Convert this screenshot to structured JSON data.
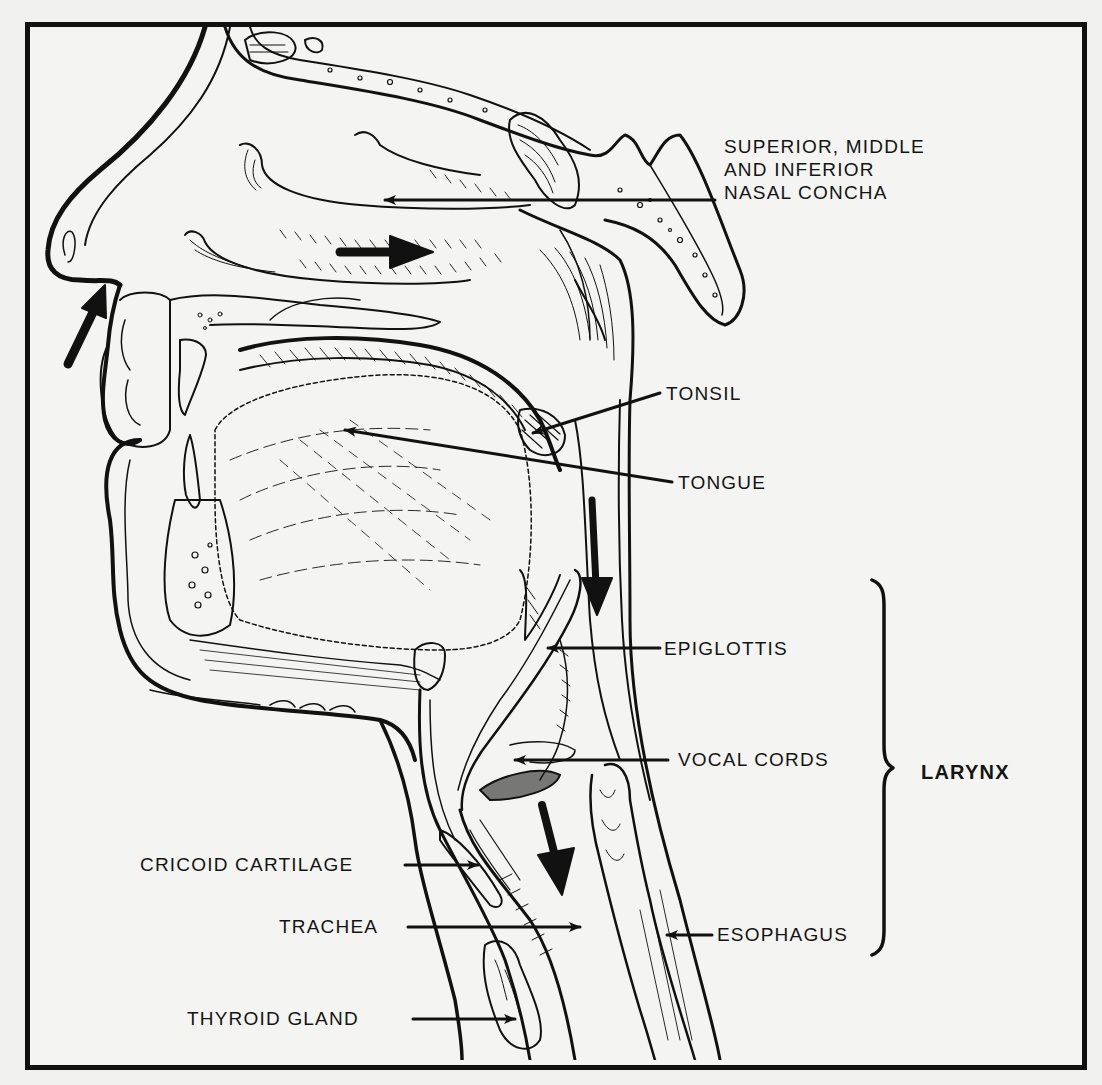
{
  "diagram": {
    "title": "",
    "labels": {
      "nasal_concha": [
        "SUPERIOR, MIDDLE",
        "AND INFERIOR",
        "NASAL CONCHA"
      ],
      "tonsil": "TONSIL",
      "tongue": "TONGUE",
      "epiglottis": "EPIGLOTTIS",
      "vocal_cords": "VOCAL CORDS",
      "larynx": "LARYNX",
      "cricoid_cartilage": "CRICOID CARTILAGE",
      "trachea": "TRACHEA",
      "esophagus": "ESOPHAGUS",
      "thyroid_gland": "THYROID GLAND"
    },
    "airflow_arrows": [
      {
        "name": "nostril-inflow-arrow",
        "direction": "up-right"
      },
      {
        "name": "nasal-cavity-arrow",
        "direction": "right"
      },
      {
        "name": "pharynx-arrow",
        "direction": "down"
      },
      {
        "name": "trachea-arrow",
        "direction": "down"
      }
    ],
    "bracket": {
      "groups": [
        "EPIGLOTTIS",
        "VOCAL CORDS",
        "ESOPHAGUS"
      ],
      "label": "LARYNX"
    },
    "colors": {
      "ink": "#111111",
      "paper": "#f4f4f2"
    }
  }
}
